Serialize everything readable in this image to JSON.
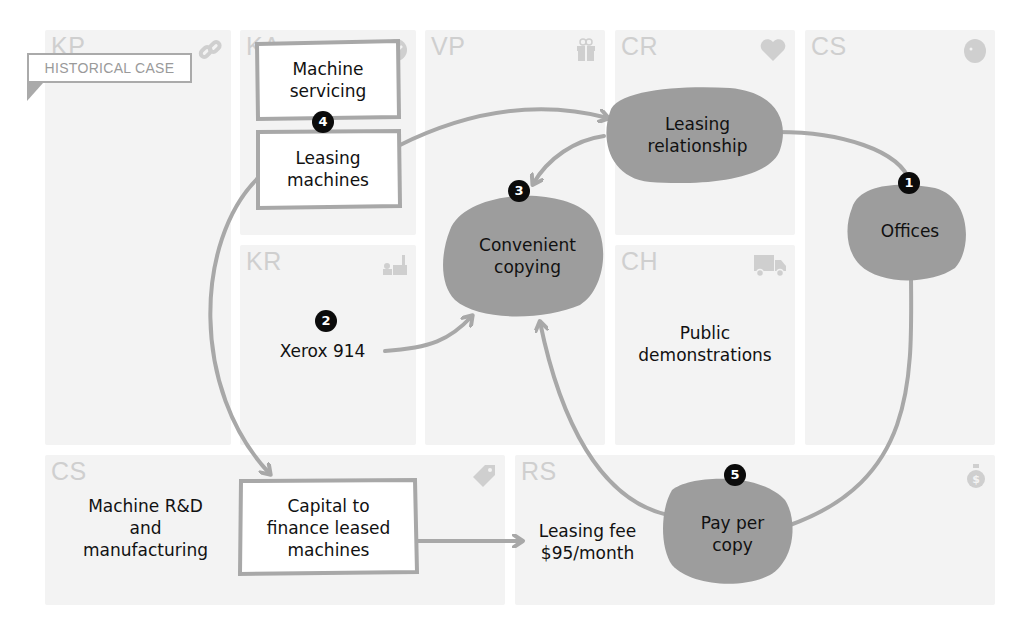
{
  "banner": {
    "label": "HISTORICAL CASE"
  },
  "canvas_blocks": [
    {
      "code": "KP",
      "name": "Key Partners",
      "icon": "link-icon"
    },
    {
      "code": "KA",
      "name": "Key Activities",
      "icon": "check-icon"
    },
    {
      "code": "VP",
      "name": "Value Propositions",
      "icon": "gift-icon"
    },
    {
      "code": "CR",
      "name": "Customer Relationships",
      "icon": "heart-icon"
    },
    {
      "code": "CS",
      "name": "Customer Segments",
      "icon": "person-head-icon"
    },
    {
      "code": "KR",
      "name": "Key Resources",
      "icon": "factory-icon"
    },
    {
      "code": "CH",
      "name": "Channels",
      "icon": "truck-icon"
    },
    {
      "code": "C$",
      "display": "CS",
      "name": "Cost Structure",
      "icon": "price-tag-icon"
    },
    {
      "code": "R$",
      "display": "RS",
      "name": "Revenue Streams",
      "icon": "money-bag-icon"
    }
  ],
  "nodes": {
    "machine_servicing": {
      "label": "Machine\nservicing",
      "shape": "box"
    },
    "leasing_machines": {
      "label": "Leasing\nmachines",
      "shape": "box"
    },
    "leasing_relationship": {
      "label": "Leasing\nrelationship",
      "shape": "blob"
    },
    "offices": {
      "label": "Offices",
      "shape": "blob"
    },
    "convenient_copying": {
      "label": "Convenient\ncopying",
      "shape": "blob"
    },
    "xerox_914": {
      "label": "Xerox 914",
      "shape": "text"
    },
    "public_demonstrations": {
      "label": "Public\ndemonstrations",
      "shape": "text"
    },
    "machine_rd": {
      "label": "Machine R&D\nand\nmanufacturing",
      "shape": "text"
    },
    "capital": {
      "label": "Capital to\nfinance leased\nmachines",
      "shape": "box"
    },
    "leasing_fee": {
      "label": "Leasing fee\n$95/month",
      "shape": "text"
    },
    "pay_per_copy": {
      "label": "Pay per\ncopy",
      "shape": "blob"
    }
  },
  "badges": [
    {
      "number": "1",
      "attached_to": "offices"
    },
    {
      "number": "2",
      "attached_to": "xerox_914"
    },
    {
      "number": "3",
      "attached_to": "convenient_copying"
    },
    {
      "number": "4",
      "attached_to": "leasing_machines"
    },
    {
      "number": "5",
      "attached_to": "pay_per_copy"
    }
  ],
  "edges": [
    {
      "from": "leasing_machines",
      "to": "leasing_relationship",
      "arrow": true
    },
    {
      "from": "leasing_relationship",
      "to": "convenient_copying",
      "arrow": true
    },
    {
      "from": "leasing_relationship",
      "to": "offices",
      "arrow": false
    },
    {
      "from": "offices",
      "to": "pay_per_copy",
      "arrow": false
    },
    {
      "from": "pay_per_copy",
      "to": "convenient_copying",
      "arrow": true
    },
    {
      "from": "xerox_914",
      "to": "convenient_copying",
      "arrow": true
    },
    {
      "from": "leasing_machines",
      "to": "capital",
      "arrow": true
    },
    {
      "from": "capital",
      "to": "leasing_fee",
      "arrow": true
    }
  ],
  "colors": {
    "blob_fill": "#9d9d9d",
    "stroke": "#a8a8a8",
    "cell_bg": "#f3f3f3",
    "cell_label": "#cfcfcf",
    "badge": "#0b0b0b",
    "text": "#111111"
  }
}
